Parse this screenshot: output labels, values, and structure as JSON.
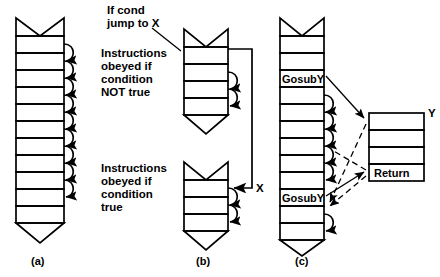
{
  "figure": {
    "kind": "program-flow-diagram",
    "background_color": "#ffffff",
    "line_color": "#000000",
    "captions": [
      {
        "id": "a",
        "text": "(a)",
        "x": 40,
        "y": 262
      },
      {
        "id": "b",
        "text": "(b)",
        "x": 190,
        "y": 262
      },
      {
        "id": "c",
        "text": "(c)",
        "x": 318,
        "y": 262
      }
    ]
  },
  "panel_a": {
    "caption": "(a)",
    "description": "straight-line sequential instruction flow",
    "rows": 11,
    "annotations": []
  },
  "panel_b": {
    "caption": "(b)",
    "description": "conditional jump to label X",
    "labels": {
      "condition_label": "If cond\njump to X",
      "condition_line1": "If cond",
      "condition_line2": "jump to X",
      "not_true_block": "Instructions\nobeyed if\ncondition\nNOT true",
      "not_true_line1": "Instructions",
      "not_true_line2": "obeyed if",
      "not_true_line3": "condition",
      "not_true_line4": "NOT true",
      "true_block": "Instructions\nobeyed if\ncondition\ntrue",
      "true_line1": "Instructions",
      "true_line2": "obeyed if",
      "true_line3": "condition",
      "true_line4": "true",
      "jump_target": "X"
    },
    "upper_rows": 4,
    "lower_rows": 3
  },
  "panel_c": {
    "caption": "(c)",
    "description": "subroutine calls to Y and return",
    "labels": {
      "gosub_first": "GosubY",
      "gosub_second": "GosubY",
      "subroutine_name": "Y",
      "return_label": "Return"
    },
    "main_rows": 11,
    "subroutine_rows": 4
  }
}
